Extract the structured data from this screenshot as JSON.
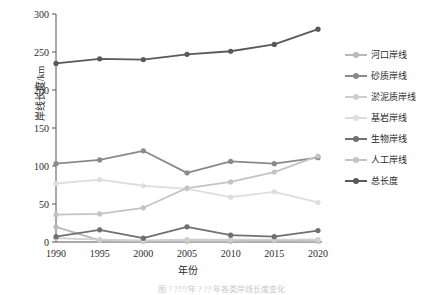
{
  "chart_data": {
    "type": "line",
    "title": "",
    "xlabel": "年份",
    "ylabel": "岸线长度/km",
    "categories": [
      "1990",
      "1995",
      "2000",
      "2005",
      "2010",
      "2015",
      "2020"
    ],
    "x": [
      1990,
      1995,
      2000,
      2005,
      2010,
      2015,
      2020
    ],
    "xlim": [
      1988,
      2022
    ],
    "ylim": [
      0,
      300
    ],
    "yticks": [
      0,
      50,
      100,
      150,
      200,
      250,
      300
    ],
    "grid": false,
    "legend_position": "right",
    "series": [
      {
        "name": "河口岸线",
        "color": "#b9b9b9",
        "values": [
          20,
          2,
          1,
          1,
          1,
          2,
          1
        ]
      },
      {
        "name": "砂质岸线",
        "color": "#8a8a8a",
        "values": [
          103,
          108,
          120,
          91,
          106,
          103,
          111
        ]
      },
      {
        "name": "淤泥质岸线",
        "color": "#cfcfcf",
        "values": [
          5,
          3,
          2,
          3,
          3,
          3,
          3
        ]
      },
      {
        "name": "基岩岸线",
        "color": "#dedede",
        "values": [
          77,
          82,
          74,
          70,
          59,
          66,
          52
        ]
      },
      {
        "name": "生物岸线",
        "color": "#707070",
        "values": [
          7,
          16,
          5,
          20,
          9,
          7,
          15
        ]
      },
      {
        "name": "人工岸线",
        "color": "#c3c3c3",
        "values": [
          36,
          37,
          45,
          71,
          79,
          92,
          113
        ]
      },
      {
        "name": "总长度",
        "color": "#595959",
        "values": [
          235,
          241,
          240,
          247,
          251,
          260,
          280
        ]
      }
    ]
  },
  "axis": {
    "y_title": "岸线长度/km",
    "x_title": "年份",
    "y_tick_labels": [
      "0",
      "50",
      "100",
      "150",
      "200",
      "250",
      "300"
    ],
    "x_tick_labels": [
      "1990",
      "1995",
      "2000",
      "2005",
      "2010",
      "2015",
      "2020"
    ]
  },
  "legend": {
    "items": [
      {
        "label": "河口岸线",
        "color": "#b9b9b9"
      },
      {
        "label": "砂质岸线",
        "color": "#8a8a8a"
      },
      {
        "label": "淤泥质岸线",
        "color": "#cfcfcf"
      },
      {
        "label": "基岩岸线",
        "color": "#dedede"
      },
      {
        "label": "生物岸线",
        "color": "#707070"
      },
      {
        "label": "人工岸线",
        "color": "#c3c3c3"
      },
      {
        "label": "总长度",
        "color": "#595959"
      }
    ]
  },
  "caption": {
    "text": "图 ? ????年 ? ?? 年各类岸线长度变化"
  }
}
